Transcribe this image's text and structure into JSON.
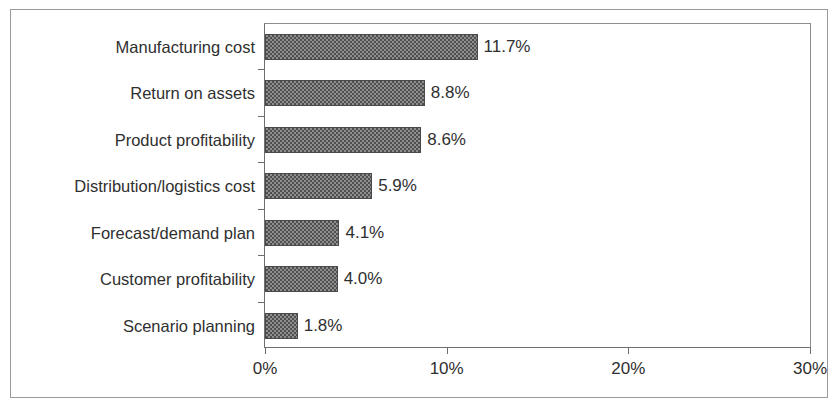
{
  "chart_data": {
    "type": "bar",
    "orientation": "horizontal",
    "title": "",
    "subtitle": "",
    "xlabel": "",
    "ylabel": "",
    "xlim": [
      0,
      30
    ],
    "xticks": [
      0,
      10,
      20,
      30
    ],
    "xtick_labels": [
      "0%",
      "10%",
      "20%",
      "30%"
    ],
    "grid": false,
    "legend": null,
    "value_suffix": "%",
    "categories": [
      "Manufacturing cost",
      "Return on assets",
      "Product profitability",
      "Distribution/logistics cost",
      "Forecast/demand plan",
      "Customer profitability",
      "Scenario planning"
    ],
    "values": [
      11.7,
      8.8,
      8.6,
      5.9,
      4.1,
      4.0,
      1.8
    ],
    "data_labels": [
      "11.7%",
      "8.8%",
      "8.6%",
      "5.9%",
      "4.1%",
      "4.0%",
      "1.8%"
    ],
    "bar_fill": "#8f8f8f",
    "bar_pattern": "checkerboard",
    "bar_border_color": "#4a4a4a",
    "axis_color": "#6e6e6e",
    "frame_color": "#9a9a9a",
    "background": "#ffffff",
    "text_color": "#2f2f2f"
  }
}
